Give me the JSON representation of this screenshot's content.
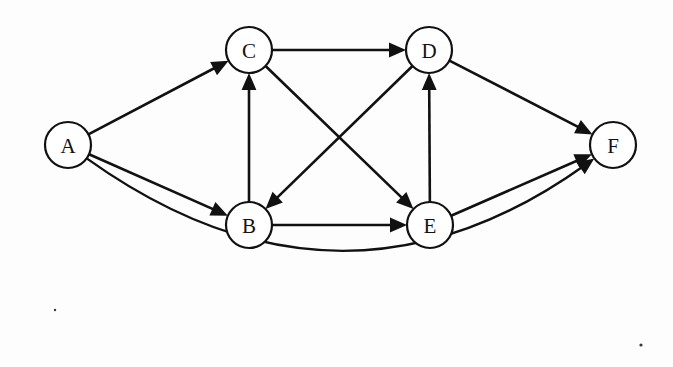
{
  "figure": {
    "kind": "directed-graph",
    "title": "",
    "background_color": "#ffffff",
    "stroke_color": "#111111",
    "node_fill": "#ffffff",
    "node_radius": 23,
    "width": 673,
    "height": 367
  },
  "nodes": [
    {
      "id": "A",
      "label": "A",
      "x": 68,
      "y": 145
    },
    {
      "id": "B",
      "label": "B",
      "x": 249,
      "y": 225
    },
    {
      "id": "C",
      "label": "C",
      "x": 249,
      "y": 50
    },
    {
      "id": "D",
      "label": "D",
      "x": 429,
      "y": 50
    },
    {
      "id": "E",
      "label": "E",
      "x": 430,
      "y": 225
    },
    {
      "id": "F",
      "label": "F",
      "x": 613,
      "y": 145
    }
  ],
  "edges": [
    {
      "id": "A-C",
      "from": "A",
      "to": "C",
      "directed": true,
      "shape": "straight"
    },
    {
      "id": "A-B",
      "from": "A",
      "to": "B",
      "directed": true,
      "shape": "straight"
    },
    {
      "id": "A-F",
      "from": "A",
      "to": "F",
      "directed": true,
      "shape": "curved",
      "curve_depth": 195
    },
    {
      "id": "B-C",
      "from": "B",
      "to": "C",
      "directed": true,
      "shape": "straight"
    },
    {
      "id": "B-E",
      "from": "B",
      "to": "E",
      "directed": true,
      "shape": "straight"
    },
    {
      "id": "C-D",
      "from": "C",
      "to": "D",
      "directed": true,
      "shape": "straight"
    },
    {
      "id": "C-E",
      "from": "C",
      "to": "E",
      "directed": true,
      "shape": "straight"
    },
    {
      "id": "D-B",
      "from": "D",
      "to": "B",
      "directed": true,
      "shape": "straight"
    },
    {
      "id": "D-F",
      "from": "D",
      "to": "F",
      "directed": true,
      "shape": "straight"
    },
    {
      "id": "E-D",
      "from": "E",
      "to": "D",
      "directed": true,
      "shape": "straight"
    },
    {
      "id": "E-F",
      "from": "E",
      "to": "F",
      "directed": true,
      "shape": "straight"
    }
  ],
  "artifacts": [
    {
      "id": "speck-bottom-right",
      "x": 641,
      "y": 345,
      "r": 1.6
    },
    {
      "id": "speck-bottom-left",
      "x": 55,
      "y": 310,
      "r": 1.2
    }
  ]
}
